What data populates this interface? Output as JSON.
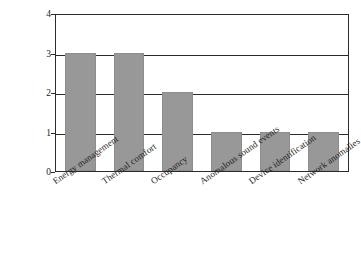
{
  "chart_data": {
    "type": "bar",
    "title": "",
    "xlabel": "",
    "ylabel": "Quantity of studies",
    "categories": [
      "Energy management",
      "Thermal comfort",
      "Occupancy",
      "Anomalous sound events",
      "Device identification",
      "Network anomalies"
    ],
    "values": [
      3,
      3,
      2,
      1,
      1,
      1
    ],
    "ylim": [
      0,
      4
    ],
    "yticks": [
      0,
      1,
      2,
      3,
      4
    ],
    "ytick_labels": [
      "0",
      "1",
      "2",
      "3",
      "4"
    ],
    "grid": true,
    "grid_axis": "y",
    "legend": false,
    "legend_position": "none",
    "bar_color": "#989898",
    "axis_color": "#2b2b2b",
    "background_color": "#ffffff",
    "xtick_label_rotation": -35
  }
}
